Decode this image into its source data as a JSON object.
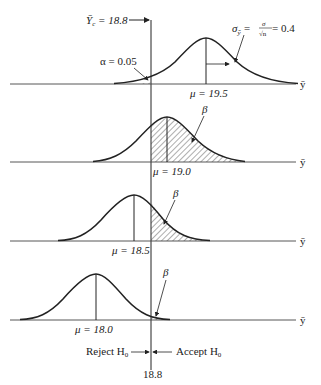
{
  "diagram": {
    "type": "hypothesis-test-power-illustration",
    "critical_value": {
      "label_symbol": "Ȳ",
      "label_sub": "c",
      "label_text": " = 18.8",
      "value": 18.8,
      "bottom_label": "18.8"
    },
    "standard_error": {
      "lhs": "σ",
      "lhs_sub": "ȳ",
      "eq1": " = ",
      "num": "σ",
      "den": "√n",
      "eq2": " = 0.4",
      "value": 0.4
    },
    "alpha_label": "α = 0.05",
    "beta_label": "β",
    "axis_label": "ȳ",
    "panels": [
      {
        "mu": 19.5,
        "label": "μ = 19.5",
        "shaded": "alpha"
      },
      {
        "mu": 19.0,
        "label": "μ = 19.0",
        "shaded": "beta"
      },
      {
        "mu": 18.5,
        "label": "μ = 18.5",
        "shaded": "beta"
      },
      {
        "mu": 18.0,
        "label": "μ = 18.0",
        "shaded": "beta"
      }
    ],
    "decision": {
      "reject": "Reject H",
      "reject_sub": "0",
      "accept": "Accept H",
      "accept_sub": "0"
    }
  }
}
